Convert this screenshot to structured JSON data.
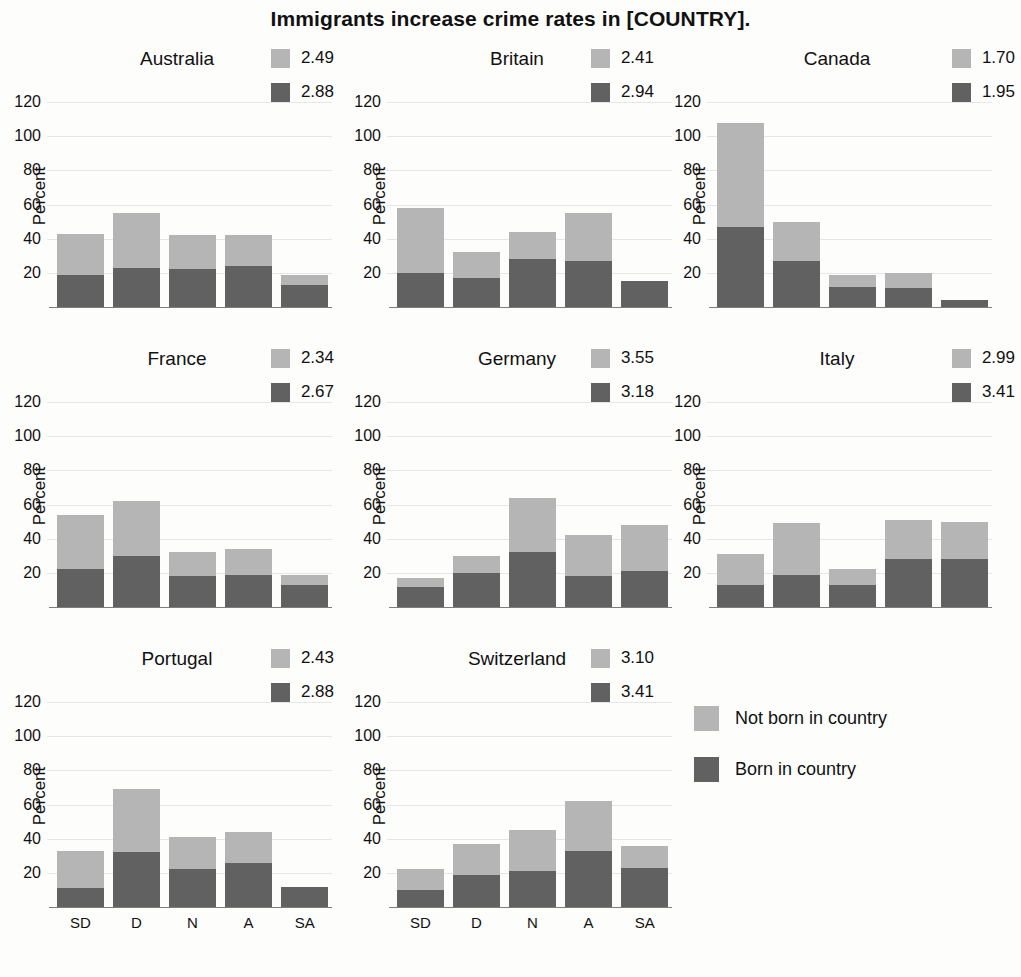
{
  "title": "Immigrants increase crime rates in [COUNTRY].",
  "axis": {
    "ylabel": "Percent",
    "yticks": [
      "20",
      "40",
      "60",
      "80",
      "100",
      "120"
    ],
    "ymin": 0,
    "ymax": 130,
    "categories": [
      "SD",
      "D",
      "N",
      "A",
      "SA"
    ]
  },
  "colors": {
    "not_born": "#b5b5b5",
    "born": "#616161",
    "gridline": "#e6e6e6",
    "text": "#111111",
    "background": "#fdfdfc"
  },
  "legend": {
    "entries": [
      {
        "label": "Not born in country",
        "color": "#b5b5b5"
      },
      {
        "label": "Born in country",
        "color": "#616161"
      }
    ]
  },
  "chart_data": {
    "type": "bar",
    "subtype": "stacked-bar-small-multiples",
    "title": "Immigrants increase crime rates in [COUNTRY].",
    "xlabel": "",
    "ylabel": "Percent",
    "ylim": [
      0,
      130
    ],
    "yticks": [
      20,
      40,
      60,
      80,
      100,
      120
    ],
    "grid": true,
    "legend_position": "bottom-right-cell",
    "categories": [
      "SD",
      "D",
      "N",
      "A",
      "SA"
    ],
    "series_names": [
      "Born in country",
      "Not born in country"
    ],
    "panels": [
      {
        "name": "Australia",
        "legend_values": [
          "2.49",
          "2.88"
        ],
        "mean_not_born": 2.49,
        "mean_born": 2.88,
        "series": [
          {
            "name": "Born in country",
            "values": [
              19,
              23,
              22,
              24,
              13
            ]
          },
          {
            "name": "Not born in country",
            "values": [
              24,
              32,
              20,
              18,
              6
            ]
          }
        ],
        "totals": [
          43,
          55,
          42,
          42,
          19
        ]
      },
      {
        "name": "Britain",
        "legend_values": [
          "2.41",
          "2.94"
        ],
        "mean_not_born": 2.41,
        "mean_born": 2.94,
        "series": [
          {
            "name": "Born in country",
            "values": [
              20,
              17,
              28,
              27,
              15
            ]
          },
          {
            "name": "Not born in country",
            "values": [
              38,
              15,
              16,
              28,
              0
            ]
          }
        ],
        "totals": [
          58,
          32,
          44,
          55,
          15
        ]
      },
      {
        "name": "Canada",
        "legend_values": [
          "1.70",
          "1.95"
        ],
        "mean_not_born": 1.7,
        "mean_born": 1.95,
        "series": [
          {
            "name": "Born in country",
            "values": [
              47,
              27,
              12,
              11,
              4
            ]
          },
          {
            "name": "Not born in country",
            "values": [
              61,
              23,
              7,
              9,
              0
            ]
          }
        ],
        "totals": [
          108,
          50,
          19,
          20,
          4
        ]
      },
      {
        "name": "France",
        "legend_values": [
          "2.34",
          "2.67"
        ],
        "mean_not_born": 2.34,
        "mean_born": 2.67,
        "series": [
          {
            "name": "Born in country",
            "values": [
              22,
              30,
              18,
              19,
              13
            ]
          },
          {
            "name": "Not born in country",
            "values": [
              32,
              32,
              14,
              15,
              6
            ]
          }
        ],
        "totals": [
          54,
          62,
          32,
          34,
          19
        ]
      },
      {
        "name": "Germany",
        "legend_values": [
          "3.55",
          "3.18"
        ],
        "mean_not_born": 3.55,
        "mean_born": 3.18,
        "series": [
          {
            "name": "Born in country",
            "values": [
              12,
              20,
              32,
              18,
              21
            ]
          },
          {
            "name": "Not born in country",
            "values": [
              5,
              10,
              32,
              24,
              27
            ]
          }
        ],
        "totals": [
          17,
          30,
          64,
          42,
          48
        ]
      },
      {
        "name": "Italy",
        "legend_values": [
          "2.99",
          "3.41"
        ],
        "mean_not_born": 2.99,
        "mean_born": 3.41,
        "series": [
          {
            "name": "Born in country",
            "values": [
              13,
              19,
              13,
              28,
              28
            ]
          },
          {
            "name": "Not born in country",
            "values": [
              18,
              30,
              9,
              23,
              22
            ]
          }
        ],
        "totals": [
          31,
          49,
          22,
          51,
          50
        ]
      },
      {
        "name": "Portugal",
        "legend_values": [
          "2.43",
          "2.88"
        ],
        "mean_not_born": 2.43,
        "mean_born": 2.88,
        "series": [
          {
            "name": "Born in country",
            "values": [
              11,
              32,
              22,
              26,
              12
            ]
          },
          {
            "name": "Not born in country",
            "values": [
              22,
              37,
              19,
              18,
              0
            ]
          }
        ],
        "totals": [
          33,
          69,
          41,
          44,
          12
        ]
      },
      {
        "name": "Switzerland",
        "legend_values": [
          "3.10",
          "3.41"
        ],
        "mean_not_born": 3.1,
        "mean_born": 3.41,
        "series": [
          {
            "name": "Born in country",
            "values": [
              10,
              19,
              21,
              33,
              23
            ]
          },
          {
            "name": "Not born in country",
            "values": [
              12,
              18,
              24,
              29,
              13
            ]
          }
        ],
        "totals": [
          22,
          37,
          45,
          62,
          36
        ]
      }
    ]
  }
}
